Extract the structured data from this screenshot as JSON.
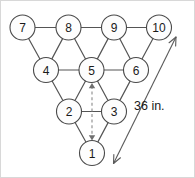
{
  "diagram": {
    "dimension": {
      "label": "36 in.",
      "value": 36,
      "unit": "in."
    },
    "nodes": [
      {
        "id": "pin-7",
        "label": "7",
        "cx": 21.5,
        "cy": 26.5,
        "r": 12.5,
        "row": 4
      },
      {
        "id": "pin-8",
        "label": "8",
        "cx": 67.5,
        "cy": 26.5,
        "r": 12.5,
        "row": 4
      },
      {
        "id": "pin-9",
        "label": "9",
        "cx": 113.0,
        "cy": 26.5,
        "r": 12.5,
        "row": 4
      },
      {
        "id": "pin-10",
        "label": "10",
        "cx": 158.0,
        "cy": 26.5,
        "r": 12.5,
        "row": 4
      },
      {
        "id": "pin-4",
        "label": "4",
        "cx": 45.0,
        "cy": 69.0,
        "r": 12.5,
        "row": 3
      },
      {
        "id": "pin-5",
        "label": "5",
        "cx": 90.5,
        "cy": 69.0,
        "r": 12.5,
        "row": 3
      },
      {
        "id": "pin-6",
        "label": "6",
        "cx": 135.0,
        "cy": 69.0,
        "r": 12.5,
        "row": 3
      },
      {
        "id": "pin-2",
        "label": "2",
        "cx": 68.0,
        "cy": 110.5,
        "r": 12.5,
        "row": 2
      },
      {
        "id": "pin-3",
        "label": "3",
        "cx": 113.0,
        "cy": 110.5,
        "r": 12.5,
        "row": 2
      },
      {
        "id": "pin-1",
        "label": "1",
        "cx": 91.0,
        "cy": 152.0,
        "r": 12.5,
        "row": 1
      }
    ],
    "edges": [
      {
        "id": "edge-7-8",
        "from": "pin-7",
        "to": "pin-8"
      },
      {
        "id": "edge-8-9",
        "from": "pin-8",
        "to": "pin-9"
      },
      {
        "id": "edge-9-10",
        "from": "pin-9",
        "to": "pin-10"
      },
      {
        "id": "edge-4-5",
        "from": "pin-4",
        "to": "pin-5"
      },
      {
        "id": "edge-5-6",
        "from": "pin-5",
        "to": "pin-6"
      },
      {
        "id": "edge-2-3",
        "from": "pin-2",
        "to": "pin-3"
      },
      {
        "id": "edge-7-4",
        "from": "pin-7",
        "to": "pin-4"
      },
      {
        "id": "edge-8-4",
        "from": "pin-8",
        "to": "pin-4"
      },
      {
        "id": "edge-8-5",
        "from": "pin-8",
        "to": "pin-5"
      },
      {
        "id": "edge-9-5",
        "from": "pin-9",
        "to": "pin-5"
      },
      {
        "id": "edge-9-6",
        "from": "pin-9",
        "to": "pin-6"
      },
      {
        "id": "edge-10-6",
        "from": "pin-10",
        "to": "pin-6"
      },
      {
        "id": "edge-4-2",
        "from": "pin-4",
        "to": "pin-2"
      },
      {
        "id": "edge-5-2",
        "from": "pin-5",
        "to": "pin-2"
      },
      {
        "id": "edge-5-3",
        "from": "pin-5",
        "to": "pin-3"
      },
      {
        "id": "edge-6-3",
        "from": "pin-6",
        "to": "pin-3"
      },
      {
        "id": "edge-2-1",
        "from": "pin-2",
        "to": "pin-1"
      },
      {
        "id": "edge-3-1",
        "from": "pin-3",
        "to": "pin-1"
      }
    ],
    "dashed_arrow": {
      "id": "height-arrow",
      "from": "pin-5",
      "to": "pin-1",
      "x": 91,
      "y1": 82,
      "y2": 139.5
    },
    "dimension_line": {
      "id": "dimension-36in",
      "x1": 175.0,
      "y1": 36.0,
      "x2": 112.5,
      "y2": 162.5,
      "label_x": 133,
      "label_y": 105
    }
  }
}
